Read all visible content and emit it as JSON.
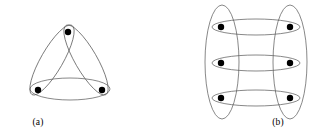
{
  "figure": {
    "background_color": "#ffffff",
    "edge_color": "#555555",
    "vertex_color": "#000000",
    "width": 321,
    "height": 139
  },
  "panels": [
    {
      "id": "a",
      "caption": "(a)",
      "description": "three-vertex hypergraph with three crossing elliptical hyperedges",
      "vertex_count": 3,
      "hyperedge_count": 3,
      "vertices": [
        {
          "name": "vertex-top",
          "x": 68,
          "y": 32,
          "r": 3.2
        },
        {
          "name": "vertex-bottom-left",
          "x": 38,
          "y": 90,
          "r": 3.2
        },
        {
          "name": "vertex-bottom-right",
          "x": 102,
          "y": 90,
          "r": 3.2
        }
      ],
      "hyperedges": [
        {
          "name": "hyperedge-bottom",
          "cx": 70,
          "cy": 89,
          "rx": 40,
          "ry": 11,
          "rotation": 0
        },
        {
          "name": "hyperedge-left",
          "cx": 52,
          "cy": 60,
          "rx": 40,
          "ry": 11,
          "rotation": 120
        },
        {
          "name": "hyperedge-right",
          "cx": 86,
          "cy": 60,
          "rx": 40,
          "ry": 11,
          "rotation": 240
        }
      ]
    },
    {
      "id": "b",
      "caption": "(b)",
      "description": "six-vertex hypergraph, two vertical column hyperedges and three horizontal row hyperedges",
      "vertex_count": 6,
      "hyperedge_count": 5,
      "vertices": [
        {
          "name": "vertex-row1-left",
          "x": 60,
          "y": 27,
          "r": 3.2
        },
        {
          "name": "vertex-row1-right",
          "x": 129,
          "y": 27,
          "r": 3.2
        },
        {
          "name": "vertex-row2-left",
          "x": 60,
          "y": 63,
          "r": 3.2
        },
        {
          "name": "vertex-row2-right",
          "x": 129,
          "y": 63,
          "r": 3.2
        },
        {
          "name": "vertex-row3-left",
          "x": 60,
          "y": 98,
          "r": 3.2
        },
        {
          "name": "vertex-row3-right",
          "x": 129,
          "y": 98,
          "r": 3.2
        }
      ],
      "hyperedges": [
        {
          "name": "hyperedge-column-left",
          "cx": 61,
          "cy": 62,
          "rx": 17,
          "ry": 57,
          "rotation": 0
        },
        {
          "name": "hyperedge-column-right",
          "cx": 129,
          "cy": 62,
          "rx": 17,
          "ry": 57,
          "rotation": 0
        },
        {
          "name": "hyperedge-row-top",
          "cx": 95,
          "cy": 27,
          "rx": 44,
          "ry": 8,
          "rotation": 0
        },
        {
          "name": "hyperedge-row-middle",
          "cx": 95,
          "cy": 63,
          "rx": 44,
          "ry": 8,
          "rotation": 0
        },
        {
          "name": "hyperedge-row-bottom",
          "cx": 95,
          "cy": 98,
          "rx": 44,
          "ry": 8,
          "rotation": 0
        }
      ]
    }
  ]
}
